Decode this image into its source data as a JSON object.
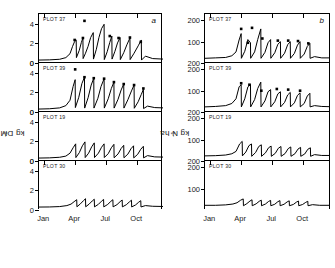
{
  "figure": {
    "panel_letters": [
      "a",
      "b"
    ],
    "plots": [
      "PLOT 37",
      "PLOT 39",
      "PLOT 19",
      "PLOT 30"
    ]
  },
  "chart_data": [
    {
      "type": "line",
      "panel_letter": "a",
      "title": "",
      "xlabel": "",
      "ylabel": "kg DM ha",
      "ylabel_exponent": "-1",
      "xlim": [
        0,
        12
      ],
      "ylim": [
        0,
        5
      ],
      "yticks": [
        0,
        2,
        4
      ],
      "ytick_labels": [
        "0",
        "2",
        "4"
      ],
      "xticks": [
        0.5,
        3.5,
        6.5,
        9.5
      ],
      "xtick_labels": [
        "Jan",
        "Apr",
        "Jul",
        "Oct"
      ],
      "grid": false,
      "legend": "none",
      "subpanels": [
        {
          "name": "PLOT 37",
          "marker": "filled-square",
          "x": [
            0.0,
            1.0,
            2.0,
            2.6,
            3.0,
            3.25,
            3.45,
            3.6,
            3.62,
            3.9,
            4.1,
            4.25,
            4.27,
            4.5,
            4.75,
            5.0,
            5.25,
            5.27,
            5.55,
            5.8,
            6.05,
            6.3,
            6.32,
            6.6,
            6.85,
            7.05,
            7.07,
            7.35,
            7.6,
            7.85,
            7.87,
            8.2,
            8.5,
            8.8,
            8.82,
            9.2,
            9.6,
            9.9,
            9.92,
            10.3,
            11.0,
            12.0
          ],
          "y": [
            0.3,
            0.32,
            0.38,
            0.55,
            0.95,
            1.7,
            2.2,
            2.35,
            0.55,
            1.3,
            2.1,
            2.55,
            0.45,
            1.0,
            1.7,
            2.6,
            3.1,
            0.4,
            1.4,
            2.6,
            3.5,
            3.95,
            0.35,
            1.15,
            2.1,
            2.75,
            0.4,
            1.2,
            2.05,
            2.6,
            0.35,
            1.05,
            1.85,
            2.55,
            0.35,
            1.0,
            1.75,
            2.35,
            0.3,
            0.7,
            0.45,
            0.4
          ],
          "markers": [
            {
              "x": 3.45,
              "y": 2.35
            },
            {
              "x": 4.25,
              "y": 2.55
            },
            {
              "x": 4.4,
              "y": 4.3
            },
            {
              "x": 6.85,
              "y": 2.75
            },
            {
              "x": 7.7,
              "y": 2.55
            },
            {
              "x": 8.8,
              "y": 2.6
            },
            {
              "x": 9.85,
              "y": 2.15
            }
          ]
        },
        {
          "name": "PLOT 39",
          "marker": "filled-square",
          "x": [
            0.0,
            1.0,
            2.0,
            2.6,
            3.0,
            3.3,
            3.5,
            3.52,
            3.85,
            4.15,
            4.4,
            4.42,
            4.75,
            5.05,
            5.3,
            5.32,
            5.7,
            6.0,
            6.3,
            6.32,
            6.7,
            7.0,
            7.25,
            7.27,
            7.65,
            7.95,
            8.2,
            8.22,
            8.6,
            8.95,
            9.2,
            9.22,
            9.6,
            9.9,
            10.1,
            10.12,
            10.5,
            11.2,
            12.0
          ],
          "y": [
            0.3,
            0.33,
            0.42,
            0.65,
            1.2,
            2.6,
            3.3,
            0.45,
            1.5,
            2.9,
            3.55,
            0.4,
            1.45,
            2.75,
            3.45,
            0.4,
            1.4,
            2.6,
            3.4,
            0.4,
            1.35,
            2.4,
            3.05,
            0.4,
            1.3,
            2.25,
            2.85,
            0.4,
            1.25,
            2.15,
            2.75,
            0.38,
            1.05,
            1.8,
            2.3,
            0.35,
            0.6,
            0.45,
            0.42
          ],
          "markers": [
            {
              "x": 3.5,
              "y": 4.35
            },
            {
              "x": 4.4,
              "y": 3.55
            },
            {
              "x": 5.3,
              "y": 3.45
            },
            {
              "x": 6.3,
              "y": 3.4
            },
            {
              "x": 7.25,
              "y": 3.05
            },
            {
              "x": 8.2,
              "y": 2.85
            },
            {
              "x": 9.2,
              "y": 2.75
            },
            {
              "x": 10.1,
              "y": 2.4
            }
          ]
        },
        {
          "name": "PLOT 19",
          "marker": "none",
          "x": [
            0.0,
            1.0,
            2.0,
            2.6,
            3.0,
            3.3,
            3.55,
            3.57,
            3.9,
            4.2,
            4.45,
            4.47,
            4.8,
            5.1,
            5.35,
            5.37,
            5.75,
            6.05,
            6.3,
            6.32,
            6.7,
            7.0,
            7.25,
            7.27,
            7.65,
            7.95,
            8.2,
            8.22,
            8.6,
            8.9,
            9.15,
            9.17,
            9.55,
            9.85,
            10.1,
            10.12,
            10.5,
            11.2,
            12.0
          ],
          "y": [
            0.3,
            0.32,
            0.38,
            0.5,
            0.8,
            1.35,
            1.75,
            0.35,
            0.85,
            1.55,
            1.95,
            0.35,
            0.8,
            1.45,
            1.85,
            0.35,
            0.8,
            1.4,
            1.75,
            0.35,
            0.75,
            1.35,
            1.7,
            0.33,
            0.72,
            1.28,
            1.6,
            0.33,
            0.7,
            1.25,
            1.55,
            0.32,
            0.68,
            1.2,
            1.5,
            0.32,
            0.55,
            0.42,
            0.4
          ],
          "markers": []
        },
        {
          "name": "PLOT 30",
          "marker": "none",
          "x": [
            0.0,
            1.0,
            2.0,
            2.7,
            3.1,
            3.4,
            3.65,
            3.67,
            4.0,
            4.3,
            4.5,
            4.52,
            4.85,
            5.15,
            5.35,
            5.37,
            5.75,
            6.05,
            6.25,
            6.27,
            6.65,
            6.95,
            7.15,
            7.17,
            7.55,
            7.85,
            8.05,
            8.07,
            8.45,
            8.75,
            8.95,
            8.97,
            9.35,
            9.65,
            9.85,
            9.87,
            10.3,
            11.0,
            12.0
          ],
          "y": [
            0.3,
            0.31,
            0.35,
            0.45,
            0.6,
            0.85,
            1.05,
            0.33,
            0.62,
            0.95,
            1.15,
            0.33,
            0.6,
            0.92,
            1.1,
            0.32,
            0.58,
            0.9,
            1.08,
            0.32,
            0.57,
            0.88,
            1.05,
            0.32,
            0.55,
            0.85,
            1.02,
            0.32,
            0.54,
            0.83,
            1.0,
            0.31,
            0.52,
            0.8,
            0.95,
            0.31,
            0.45,
            0.38,
            0.36
          ],
          "markers": []
        }
      ]
    },
    {
      "type": "line",
      "panel_letter": "b",
      "title": "",
      "xlabel": "",
      "ylabel": "kg N ha",
      "ylabel_exponent": "-1",
      "xlim": [
        0,
        12
      ],
      "ylim": [
        0,
        230
      ],
      "yticks": [
        100,
        200
      ],
      "ytick_labels": [
        "100",
        "200"
      ],
      "xticks": [
        0.5,
        3.5,
        6.5,
        9.5
      ],
      "xtick_labels": [
        "Jan",
        "Apr",
        "Jul",
        "Oct"
      ],
      "grid": false,
      "legend": "none",
      "subpanels": [
        {
          "name": "PLOT 37",
          "marker": "filled-square",
          "x": [
            0.0,
            1.0,
            2.0,
            2.6,
            3.0,
            3.3,
            3.5,
            3.52,
            3.85,
            4.15,
            4.4,
            4.42,
            4.8,
            5.1,
            5.4,
            5.42,
            5.8,
            6.1,
            6.35,
            6.37,
            6.75,
            7.05,
            7.3,
            7.32,
            7.7,
            8.0,
            8.25,
            8.27,
            8.65,
            8.95,
            9.2,
            9.22,
            9.6,
            9.9,
            10.15,
            10.17,
            10.6,
            11.3,
            12.0
          ],
          "y": [
            22,
            24,
            26,
            34,
            52,
            108,
            138,
            22,
            55,
            110,
            95,
            22,
            52,
            110,
            160,
            22,
            50,
            95,
            110,
            22,
            48,
            88,
            100,
            22,
            46,
            86,
            100,
            22,
            45,
            84,
            100,
            22,
            42,
            78,
            92,
            22,
            30,
            24,
            24
          ],
          "markers": [
            {
              "x": 3.5,
              "y": 160
            },
            {
              "x": 4.15,
              "y": 95
            },
            {
              "x": 4.55,
              "y": 165
            },
            {
              "x": 5.55,
              "y": 115
            },
            {
              "x": 7.05,
              "y": 105
            },
            {
              "x": 8.05,
              "y": 105
            },
            {
              "x": 9.0,
              "y": 103
            },
            {
              "x": 10.0,
              "y": 92
            }
          ]
        },
        {
          "name": "PLOT 39",
          "marker": "filled-square",
          "x": [
            0.0,
            1.0,
            2.0,
            2.6,
            3.0,
            3.3,
            3.5,
            3.52,
            3.85,
            4.15,
            4.4,
            4.42,
            4.8,
            5.1,
            5.4,
            5.42,
            5.8,
            6.1,
            6.35,
            6.37,
            6.75,
            7.05,
            7.3,
            7.32,
            7.7,
            8.0,
            8.25,
            8.27,
            8.65,
            8.95,
            9.2,
            9.22,
            9.6,
            9.9,
            10.15,
            10.17,
            10.6,
            11.3,
            12.0
          ],
          "y": [
            24,
            26,
            30,
            40,
            62,
            118,
            128,
            24,
            62,
            118,
            130,
            24,
            58,
            110,
            140,
            24,
            52,
            95,
            105,
            24,
            48,
            85,
            95,
            24,
            45,
            80,
            92,
            24,
            43,
            78,
            90,
            24,
            40,
            75,
            88,
            24,
            30,
            26,
            25
          ],
          "markers": [
            {
              "x": 3.5,
              "y": 135
            },
            {
              "x": 4.3,
              "y": 128
            },
            {
              "x": 5.45,
              "y": 100
            },
            {
              "x": 6.95,
              "y": 108
            },
            {
              "x": 8.05,
              "y": 105
            },
            {
              "x": 9.2,
              "y": 100
            }
          ]
        },
        {
          "name": "PLOT 19",
          "marker": "none",
          "x": [
            0.0,
            1.0,
            2.0,
            2.6,
            3.0,
            3.35,
            3.6,
            3.62,
            3.95,
            4.25,
            4.5,
            4.52,
            4.9,
            5.2,
            5.45,
            5.47,
            5.85,
            6.15,
            6.4,
            6.42,
            6.8,
            7.1,
            7.35,
            7.37,
            7.75,
            8.05,
            8.3,
            8.32,
            8.7,
            9.0,
            9.25,
            9.27,
            9.65,
            9.95,
            10.2,
            10.22,
            10.6,
            11.3,
            12.0
          ],
          "y": [
            24,
            25,
            28,
            34,
            45,
            80,
            92,
            24,
            42,
            72,
            80,
            22,
            40,
            68,
            76,
            22,
            38,
            62,
            70,
            22,
            36,
            60,
            68,
            22,
            35,
            58,
            66,
            22,
            34,
            56,
            64,
            22,
            33,
            55,
            62,
            22,
            30,
            26,
            26
          ],
          "markers": []
        },
        {
          "name": "PLOT 30",
          "marker": "none",
          "x": [
            0.0,
            1.0,
            2.0,
            2.7,
            3.1,
            3.45,
            3.7,
            3.72,
            4.05,
            4.35,
            4.55,
            4.57,
            4.95,
            5.25,
            5.45,
            5.47,
            5.85,
            6.15,
            6.35,
            6.37,
            6.75,
            7.05,
            7.25,
            7.27,
            7.65,
            7.95,
            8.15,
            8.17,
            8.55,
            8.85,
            9.05,
            9.07,
            9.45,
            9.75,
            9.95,
            9.97,
            10.4,
            11.1,
            12.0
          ],
          "y": [
            22,
            22,
            24,
            28,
            34,
            46,
            52,
            20,
            30,
            42,
            48,
            20,
            29,
            41,
            46,
            20,
            28,
            40,
            45,
            20,
            27,
            39,
            44,
            20,
            27,
            38,
            43,
            20,
            26,
            37,
            42,
            20,
            26,
            36,
            41,
            20,
            25,
            22,
            22
          ],
          "markers": []
        }
      ]
    }
  ]
}
